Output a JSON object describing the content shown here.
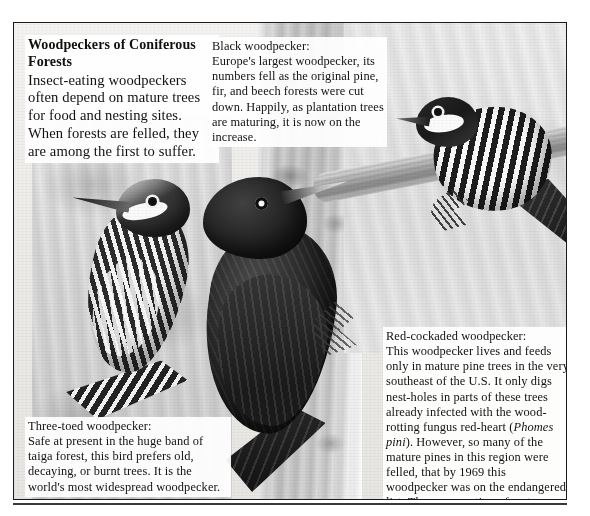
{
  "page": {
    "kind": "illustrated-encyclopedia-plate",
    "subject": "Woodpeckers of Coniferous Forests"
  },
  "captions": {
    "intro": {
      "title": "Woodpeckers of Coniferous Forests",
      "body": "Insect-eating woodpeckers often depend on mature trees for food and nesting sites. When forests are felled, they are among the first to suffer."
    },
    "black_woodpecker": {
      "lead": "Black woodpecker:",
      "body": "Europe's largest woodpecker, its numbers fell as the original pine, fir, and beech forests were cut down. Happily, as plantation trees are maturing, it is now on the increase."
    },
    "red_cockaded_woodpecker": {
      "lead": "Red-cockaded woodpecker:",
      "body_part1": "This woodpecker lives and feeds only in mature pine trees in the very southeast of the U.S. It only digs nest-holes in parts of these trees already infected with the wood-rotting fungus red-heart (",
      "species_italic": "Phomes pini",
      "body_part2": "). However, so many of the mature pines in this region were felled, that by 1969 this woodpecker was on the endangered list. The conservation of mature pines has helped the population to recover."
    },
    "three_toed_woodpecker": {
      "lead": "Three-toed woodpecker:",
      "body": "Safe at present in the huge band of taiga forest, this bird prefers old, decaying, or burnt trees. It is the world's most widespread woodpecker."
    }
  },
  "illustration": {
    "birds": [
      {
        "name": "three-toed-woodpecker",
        "position": "left"
      },
      {
        "name": "black-woodpecker",
        "position": "center"
      },
      {
        "name": "red-cockaded-woodpecker",
        "position": "top-right"
      }
    ],
    "background_elements": [
      "tree-trunk-center",
      "bark-left",
      "branch-right",
      "paper-wash"
    ]
  },
  "colors": {
    "page_background": "#ffffff",
    "plate_background": "#f2f1ef",
    "frame_border": "#1a1a1a",
    "rule": "#3a3a3a",
    "text": "#121110"
  }
}
